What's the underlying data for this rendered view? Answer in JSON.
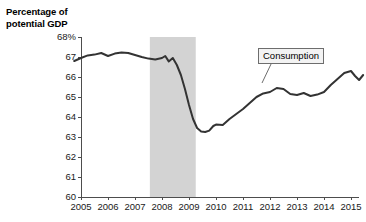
{
  "chart_data": {
    "type": "line",
    "title": "Percentage of potential GDP",
    "xlabel": "",
    "ylabel": "Percentage of potential GDP",
    "xlim": [
      2004.7,
      2015.6
    ],
    "ylim": [
      60,
      68
    ],
    "grid": false,
    "legend_position": "inline-callout",
    "series": [
      {
        "name": "Consumption",
        "color": "#333333",
        "points": [
          [
            2004.75,
            66.8
          ],
          [
            2005.0,
            66.95
          ],
          [
            2005.25,
            67.08
          ],
          [
            2005.5,
            67.12
          ],
          [
            2005.75,
            67.2
          ],
          [
            2006.0,
            67.05
          ],
          [
            2006.25,
            67.17
          ],
          [
            2006.5,
            67.22
          ],
          [
            2006.75,
            67.2
          ],
          [
            2007.0,
            67.1
          ],
          [
            2007.25,
            67.0
          ],
          [
            2007.5,
            66.92
          ],
          [
            2007.75,
            66.88
          ],
          [
            2008.0,
            66.95
          ],
          [
            2008.12,
            67.05
          ],
          [
            2008.25,
            66.78
          ],
          [
            2008.4,
            66.95
          ],
          [
            2008.55,
            66.6
          ],
          [
            2008.7,
            66.1
          ],
          [
            2008.85,
            65.4
          ],
          [
            2009.0,
            64.6
          ],
          [
            2009.15,
            63.9
          ],
          [
            2009.3,
            63.45
          ],
          [
            2009.45,
            63.28
          ],
          [
            2009.6,
            63.25
          ],
          [
            2009.75,
            63.32
          ],
          [
            2009.9,
            63.55
          ],
          [
            2010.0,
            63.62
          ],
          [
            2010.25,
            63.6
          ],
          [
            2010.5,
            63.9
          ],
          [
            2010.75,
            64.15
          ],
          [
            2011.0,
            64.4
          ],
          [
            2011.25,
            64.7
          ],
          [
            2011.5,
            65.0
          ],
          [
            2011.75,
            65.18
          ],
          [
            2012.0,
            65.25
          ],
          [
            2012.25,
            65.45
          ],
          [
            2012.5,
            65.4
          ],
          [
            2012.75,
            65.15
          ],
          [
            2013.0,
            65.1
          ],
          [
            2013.25,
            65.2
          ],
          [
            2013.5,
            65.05
          ],
          [
            2013.75,
            65.12
          ],
          [
            2014.0,
            65.25
          ],
          [
            2014.25,
            65.6
          ],
          [
            2014.5,
            65.9
          ],
          [
            2014.75,
            66.2
          ],
          [
            2015.0,
            66.3
          ],
          [
            2015.15,
            66.05
          ],
          [
            2015.3,
            65.85
          ],
          [
            2015.45,
            66.1
          ]
        ]
      }
    ],
    "y_ticks": [
      60,
      61,
      62,
      63,
      64,
      65,
      66,
      67,
      68
    ],
    "y_tick_labels": [
      "60",
      "61",
      "62",
      "63",
      "64",
      "65",
      "66",
      "67",
      "68%"
    ],
    "x_ticks": [
      2005,
      2006,
      2007,
      2008,
      2009,
      2010,
      2011,
      2012,
      2013,
      2014,
      2015
    ],
    "x_tick_labels": [
      "2005",
      "2006",
      "2007",
      "2008",
      "2009",
      "2010",
      "2011",
      "2012",
      "2013",
      "2014",
      "2015"
    ],
    "shaded_regions": [
      {
        "name": "recession-band",
        "start": 2007.55,
        "end": 2009.25,
        "color": "#d3d3d3"
      }
    ],
    "annotations": [
      {
        "name": "consumption-callout",
        "text": "Consumption",
        "box_left": 258,
        "box_top": 48,
        "leader_from": [
          272,
          62
        ],
        "leader_to": [
          262,
          83
        ]
      }
    ],
    "colors": {
      "line": "#333333",
      "axis": "#4d4d4d",
      "shade": "#d3d3d3",
      "text": "#1a1a1a",
      "callout_fill": "#f3f3f3",
      "callout_border": "#6d6d6d"
    }
  }
}
